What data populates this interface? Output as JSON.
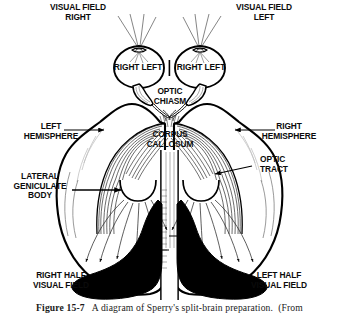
{
  "figure": {
    "caption_label": "Figure 15-7",
    "caption_text": "A diagram of Sperry's split-brain preparation.  (From",
    "ink_color": "#000000",
    "background_color": "#ffffff"
  },
  "labels": {
    "visual_field_right": "VISUAL FIELD\nRIGHT",
    "visual_field_left": "VISUAL FIELD\nLEFT",
    "eye_left_right": "RIGHT LEFT",
    "eye_right_right": "RIGHT LEFT",
    "optic_chiasm": "OPTIC\nCHIASM",
    "left_hemisphere": "LEFT\nHEMISPHERE",
    "right_hemisphere": "RIGHT\nHEMISPHERE",
    "corpus_callosum": "CORPUS\nCALLOSUM",
    "optic_tract": "OPTIC\nTRACT",
    "lateral_geniculate_body": "LATERAL\nGENICULATE\nBODY",
    "right_half_visual_field": "RIGHT HALF\nVISUAL FIELD",
    "left_half_visual_field": "LEFT HALF\nVISUAL FIELD"
  },
  "structures": [
    {
      "name": "left-eye",
      "type": "eye"
    },
    {
      "name": "right-eye",
      "type": "eye"
    },
    {
      "name": "optic-nerve",
      "type": "tract"
    },
    {
      "name": "optic-chiasm",
      "type": "crossing"
    },
    {
      "name": "optic-tract",
      "type": "tract"
    },
    {
      "name": "lateral-geniculate-body-left",
      "type": "nucleus"
    },
    {
      "name": "lateral-geniculate-body-right",
      "type": "nucleus"
    },
    {
      "name": "corpus-callosum",
      "type": "commissure"
    },
    {
      "name": "visual-cortex-left",
      "type": "cortex",
      "fill": "#000000"
    },
    {
      "name": "visual-cortex-right",
      "type": "cortex",
      "fill": "#000000"
    },
    {
      "name": "cerebral-hemisphere-left",
      "type": "hemisphere"
    },
    {
      "name": "cerebral-hemisphere-right",
      "type": "hemisphere"
    }
  ]
}
